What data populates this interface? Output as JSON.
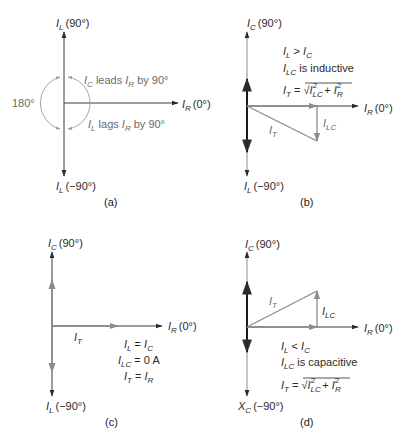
{
  "figure": {
    "panels": [
      {
        "id": "a",
        "caption": "(a)",
        "axis_labels": {
          "top": {
            "sym": "I",
            "sub": "L",
            "angle": "(90°)"
          },
          "right": {
            "sym": "I",
            "sub": "R",
            "angle": "(0°)"
          },
          "bottom": {
            "sym": "I",
            "sub": "L",
            "angle": "(−90°)"
          }
        },
        "angle_label": "180°",
        "annotations": [
          {
            "sym1": "I",
            "sub1": "C",
            "text1": " leads ",
            "sym2": "I",
            "sub2": "R",
            "text2": " by 90°"
          },
          {
            "sym1": "I",
            "sub1": "L",
            "text1": " lags ",
            "sym2": "I",
            "sub2": "R",
            "text2": " by 90°"
          }
        ]
      },
      {
        "id": "b",
        "caption": "(b)",
        "axis_labels": {
          "top": {
            "sym": "I",
            "sub": "C",
            "angle": "(90°)"
          },
          "right": {
            "sym": "I",
            "sub": "R",
            "angle": "(0°)"
          },
          "bottom": {
            "sym": "I",
            "sub": "L",
            "angle": "(−90°)"
          }
        },
        "conditions": [
          {
            "sym1": "I",
            "sub1": "L",
            "op": " > ",
            "sym2": "I",
            "sub2": "C"
          },
          {
            "sym1": "I",
            "sub1": "LC",
            "text": " is inductive"
          }
        ],
        "formula": {
          "lhs_sym": "I",
          "lhs_sub": "T",
          "eq": " = √",
          "t1_sym": "I",
          "t1_sub": "LC",
          "t1_sup": "2",
          "plus": " + ",
          "t2_sym": "I",
          "t2_sub": "R",
          "t2_sup": "2"
        },
        "vector_labels": {
          "total": {
            "sym": "I",
            "sub": "T"
          },
          "reactive": {
            "sym": "I",
            "sub": "LC"
          }
        }
      },
      {
        "id": "c",
        "caption": "(c)",
        "axis_labels": {
          "top": {
            "sym": "I",
            "sub": "C",
            "angle": "(90°)"
          },
          "right": {
            "sym": "I",
            "sub": "R",
            "angle": "(0°)"
          },
          "bottom": {
            "sym": "I",
            "sub": "L",
            "angle": "(−90°)"
          }
        },
        "conditions": [
          {
            "sym1": "I",
            "sub1": "L",
            "op": " = ",
            "sym2": "I",
            "sub2": "C"
          },
          {
            "sym1": "I",
            "sub1": "LC",
            "op": " = ",
            "value": "0 A"
          },
          {
            "sym1": "I",
            "sub1": "T",
            "op": " = ",
            "sym2": "I",
            "sub2": "R"
          }
        ],
        "vector_labels": {
          "total": {
            "sym": "I",
            "sub": "T"
          }
        }
      },
      {
        "id": "d",
        "caption": "(d)",
        "axis_labels": {
          "top": {
            "sym": "I",
            "sub": "C",
            "angle": "(90°)"
          },
          "right": {
            "sym": "I",
            "sub": "R",
            "angle": "(0°)"
          },
          "bottom": {
            "sym": "X",
            "sub": "C",
            "angle": "(−90°)"
          }
        },
        "conditions": [
          {
            "sym1": "I",
            "sub1": "L",
            "op": " < ",
            "sym2": "I",
            "sub2": "C"
          },
          {
            "sym1": "I",
            "sub1": "LC",
            "text": " is capacitive"
          }
        ],
        "formula": {
          "lhs_sym": "I",
          "lhs_sub": "T",
          "eq": " = √",
          "t1_sym": "I",
          "t1_sub": "LC",
          "t1_sup": "2",
          "plus": " + ",
          "t2_sym": "I",
          "t2_sub": "R",
          "t2_sup": "2"
        },
        "vector_labels": {
          "total": {
            "sym": "I",
            "sub": "T"
          },
          "reactive": {
            "sym": "I",
            "sub": "LC"
          }
        }
      }
    ],
    "colors": {
      "axis": "#3a3a3a",
      "dark_vector": "#1a1a1a",
      "gray_vector": "#8c8c8c",
      "text": "#2a2a2a"
    }
  }
}
